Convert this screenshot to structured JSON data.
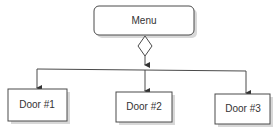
{
  "diagram": {
    "root": {
      "label": "Menu"
    },
    "decision": {
      "shape": "diamond"
    },
    "children": [
      {
        "label": "Door #1"
      },
      {
        "label": "Door #2"
      },
      {
        "label": "Door #3"
      }
    ],
    "colors": {
      "stroke": "#4a4a4a",
      "fill": "#ffffff",
      "shadow": "#d8d8d8",
      "text": "#333333"
    }
  }
}
